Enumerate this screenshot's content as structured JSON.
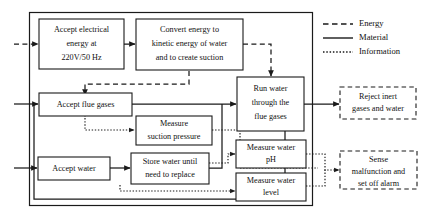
{
  "diagram": {
    "system_boundary": {
      "label": "system boundary"
    },
    "blocks": [
      {
        "id": "accept-electrical-energy",
        "lines": [
          "Accept electrical",
          "energy at",
          "220V/50 Hz"
        ],
        "style": "solid"
      },
      {
        "id": "convert-energy",
        "lines": [
          "Convert energy to",
          "kinetic energy of water",
          "and to create suction"
        ],
        "style": "solid"
      },
      {
        "id": "accept-flue-gases",
        "lines": [
          "Accept flue gases"
        ],
        "style": "solid"
      },
      {
        "id": "measure-suction-pressure",
        "lines": [
          "Measure",
          "suction pressure"
        ],
        "style": "solid"
      },
      {
        "id": "accept-water",
        "lines": [
          "Accept water"
        ],
        "style": "solid"
      },
      {
        "id": "store-water",
        "lines": [
          "Store water until",
          "need to replace"
        ],
        "style": "solid"
      },
      {
        "id": "run-water-through-flue-gases",
        "lines": [
          "Run water",
          "through the",
          "flue gases"
        ],
        "style": "solid"
      },
      {
        "id": "measure-water-ph",
        "lines": [
          "Measure water",
          "pH"
        ],
        "style": "solid"
      },
      {
        "id": "measure-water-level",
        "lines": [
          "Measure water",
          "level"
        ],
        "style": "solid"
      },
      {
        "id": "reject-inert-gases-and-water",
        "lines": [
          "Reject inert",
          "gases and water"
        ],
        "style": "dashed"
      },
      {
        "id": "sense-malfunction",
        "lines": [
          "Sense",
          "malfunction and",
          "set off alarm"
        ],
        "style": "dashed"
      }
    ],
    "legend": {
      "items": [
        {
          "id": "legend-energy",
          "label": "Energy",
          "line_style": "dashed"
        },
        {
          "id": "legend-material",
          "label": "Material",
          "line_style": "solid"
        },
        {
          "id": "legend-information",
          "label": "Information",
          "line_style": "dotted"
        }
      ]
    },
    "colors": {
      "stroke": "#1a1a1a",
      "background": "#ffffff",
      "text": "#111111"
    }
  }
}
